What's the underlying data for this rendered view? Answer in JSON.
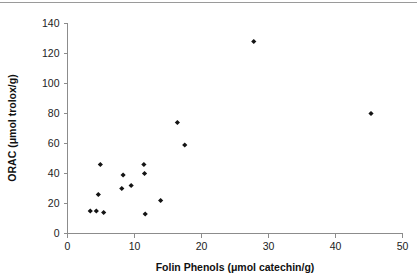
{
  "figure": {
    "name": "scatter-plot-orac-vs-folin-phenols",
    "background_color": "#ffffff",
    "marker_color": "#141414",
    "axis_color": "#8c8c8c"
  },
  "chart_data": {
    "type": "scatter",
    "title": "",
    "xlabel": "Folin Phenols (μmol catechin/g)",
    "ylabel": "ORAC (μmol trolox/g)",
    "xlim": [
      0,
      50
    ],
    "ylim": [
      0,
      140
    ],
    "xticks": [
      0,
      10,
      20,
      30,
      40,
      50
    ],
    "yticks": [
      0,
      20,
      40,
      60,
      80,
      100,
      120,
      140
    ],
    "xtick_labels": [
      "0",
      "10",
      "20",
      "30",
      "40",
      "50"
    ],
    "ytick_labels": [
      "0",
      "20",
      "40",
      "60",
      "80",
      "100",
      "120",
      "140"
    ],
    "grid": false,
    "legend": false,
    "legend_position": "none",
    "marker_shape": "filled-diamond",
    "series": [
      {
        "name": "samples",
        "points": [
          {
            "x": 3.4,
            "y": 15
          },
          {
            "x": 4.3,
            "y": 15
          },
          {
            "x": 4.6,
            "y": 26
          },
          {
            "x": 4.9,
            "y": 46
          },
          {
            "x": 5.4,
            "y": 14
          },
          {
            "x": 8.1,
            "y": 30
          },
          {
            "x": 8.3,
            "y": 39
          },
          {
            "x": 9.5,
            "y": 32
          },
          {
            "x": 11.4,
            "y": 46
          },
          {
            "x": 11.5,
            "y": 40
          },
          {
            "x": 11.6,
            "y": 13
          },
          {
            "x": 13.9,
            "y": 22
          },
          {
            "x": 16.4,
            "y": 74
          },
          {
            "x": 17.5,
            "y": 59
          },
          {
            "x": 27.8,
            "y": 128
          },
          {
            "x": 45.3,
            "y": 80
          }
        ]
      }
    ]
  }
}
